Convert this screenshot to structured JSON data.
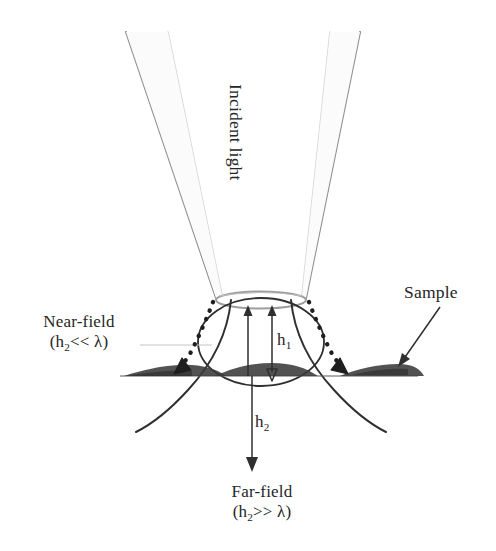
{
  "figure": {
    "kind": "nsom-near-field-far-field-schematic",
    "background_color": "#ffffff",
    "ink_color": "#2b2b2b",
    "probe_outline_color": "#9a9a9a",
    "probe_inner_color": "#d0d0d0"
  },
  "labels": {
    "incident_light": "Incident light",
    "near_field_title": "Near-field",
    "near_field_open_paren": "(h",
    "near_field_sub": "2",
    "near_field_relation": "<< ",
    "near_field_lambda": "λ",
    "near_field_close_paren": ")",
    "far_field_title": "Far-field",
    "far_field_open_paren": "(h",
    "far_field_sub": "2",
    "far_field_relation": ">> ",
    "far_field_lambda": "λ",
    "far_field_close_paren": ")",
    "sample": "Sample",
    "h1_base": "h",
    "h1_sub": "1",
    "h2_base": "h",
    "h2_sub": "2"
  },
  "annotations": {
    "near_field_condition": "(h2<< λ)",
    "far_field_condition": "(h2>> λ)",
    "h1_meaning": "h1",
    "h2_meaning": "h2"
  }
}
